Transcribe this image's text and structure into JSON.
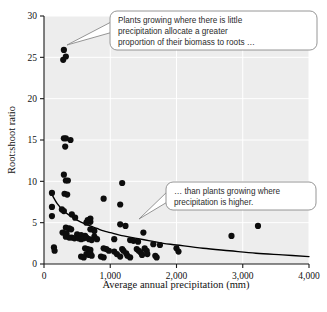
{
  "figure": {
    "name": "root-shoot-ratio-vs-precipitation-scatter"
  },
  "chart_data": {
    "type": "scatter",
    "title": "",
    "xlabel": "Average annual precipitation (mm)",
    "ylabel": "Root:shoot ratio",
    "xlim": [
      0,
      4000
    ],
    "ylim": [
      0,
      30
    ],
    "xticks": [
      0,
      1000,
      2000,
      3000,
      4000
    ],
    "xtick_labels": [
      "0",
      "1,000",
      "2,000",
      "3,000",
      "4,000"
    ],
    "yticks": [
      0,
      5,
      10,
      15,
      20,
      25,
      30
    ],
    "ytick_labels": [
      "0",
      "5",
      "10",
      "15",
      "20",
      "25",
      "30"
    ],
    "grid": true,
    "grid_color": "#ffffff",
    "plot_background": "#ededed",
    "marker_color": "#0d0d0d",
    "marker_shape": "circle",
    "marker_size_px": 3.1,
    "legend": null,
    "legend_position": "none",
    "points": [
      [
        300,
        25.9
      ],
      [
        290,
        24.7
      ],
      [
        330,
        25.1
      ],
      [
        300,
        15.2
      ],
      [
        330,
        15.2
      ],
      [
        400,
        15.0
      ],
      [
        320,
        14.2
      ],
      [
        300,
        10.8
      ],
      [
        330,
        10.1
      ],
      [
        360,
        10.1
      ],
      [
        1180,
        9.8
      ],
      [
        310,
        8.5
      ],
      [
        120,
        8.6
      ],
      [
        350,
        8.4
      ],
      [
        900,
        7.9
      ],
      [
        1150,
        7.2
      ],
      [
        120,
        6.9
      ],
      [
        270,
        6.6
      ],
      [
        300,
        6.4
      ],
      [
        120,
        5.8
      ],
      [
        420,
        6.0
      ],
      [
        470,
        5.6
      ],
      [
        700,
        5.5
      ],
      [
        660,
        5.3
      ],
      [
        700,
        5.1
      ],
      [
        640,
        5.0
      ],
      [
        1150,
        4.8
      ],
      [
        1230,
        4.6
      ],
      [
        3230,
        4.6
      ],
      [
        330,
        4.4
      ],
      [
        380,
        4.3
      ],
      [
        410,
        4.2
      ],
      [
        700,
        4.2
      ],
      [
        760,
        4.0
      ],
      [
        280,
        3.8
      ],
      [
        340,
        3.7
      ],
      [
        500,
        3.6
      ],
      [
        560,
        3.5
      ],
      [
        620,
        3.4
      ],
      [
        1500,
        3.8
      ],
      [
        2830,
        3.4
      ],
      [
        330,
        3.3
      ],
      [
        380,
        3.2
      ],
      [
        420,
        3.2
      ],
      [
        460,
        3.1
      ],
      [
        520,
        3.1
      ],
      [
        560,
        3.0
      ],
      [
        600,
        3.1
      ],
      [
        640,
        3.2
      ],
      [
        680,
        3.0
      ],
      [
        720,
        2.9
      ],
      [
        760,
        3.3
      ],
      [
        800,
        3.0
      ],
      [
        1060,
        3.0
      ],
      [
        1300,
        2.9
      ],
      [
        1350,
        2.8
      ],
      [
        1420,
        2.7
      ],
      [
        1650,
        2.4
      ],
      [
        1750,
        2.3
      ],
      [
        150,
        2.0
      ],
      [
        160,
        1.6
      ],
      [
        620,
        1.9
      ],
      [
        660,
        1.8
      ],
      [
        700,
        1.7
      ],
      [
        700,
        1.3
      ],
      [
        640,
        1.2
      ],
      [
        680,
        1.1
      ],
      [
        720,
        1.0
      ],
      [
        900,
        1.9
      ],
      [
        940,
        1.8
      ],
      [
        980,
        1.6
      ],
      [
        1060,
        1.5
      ],
      [
        1100,
        1.2
      ],
      [
        1180,
        1.8
      ],
      [
        1200,
        1.6
      ],
      [
        1240,
        1.3
      ],
      [
        1260,
        1.0
      ],
      [
        1400,
        1.8
      ],
      [
        1430,
        1.6
      ],
      [
        1460,
        1.4
      ],
      [
        1480,
        1.1
      ],
      [
        1520,
        1.9
      ],
      [
        1550,
        1.6
      ],
      [
        1560,
        1.2
      ],
      [
        1680,
        1.0
      ],
      [
        1700,
        0.8
      ],
      [
        2000,
        1.9
      ],
      [
        2030,
        1.5
      ],
      [
        860,
        0.9
      ],
      [
        900,
        0.8
      ],
      [
        1150,
        0.9
      ],
      [
        1300,
        0.8
      ],
      [
        560,
        0.9
      ],
      [
        600,
        0.8
      ]
    ],
    "trend_curve": {
      "description": "fitted declining power/decay curve through the scatter",
      "color": "#000000",
      "points": [
        [
          100,
          8.7
        ],
        [
          200,
          7.3
        ],
        [
          300,
          6.4
        ],
        [
          400,
          5.8
        ],
        [
          500,
          5.3
        ],
        [
          600,
          4.9
        ],
        [
          700,
          4.6
        ],
        [
          800,
          4.3
        ],
        [
          900,
          4.0
        ],
        [
          1000,
          3.8
        ],
        [
          1200,
          3.4
        ],
        [
          1400,
          3.1
        ],
        [
          1600,
          2.8
        ],
        [
          1800,
          2.5
        ],
        [
          2000,
          2.3
        ],
        [
          2400,
          1.9
        ],
        [
          2800,
          1.6
        ],
        [
          3200,
          1.3
        ],
        [
          3600,
          1.1
        ],
        [
          4000,
          0.9
        ]
      ]
    },
    "annotations": [
      {
        "id": "callout-upper",
        "lines": [
          "Plants growing where there is little",
          "precipitation allocate a greater",
          "proportion of their biomass to roots …"
        ],
        "points_to": "high root:shoot ratio points at low precipitation"
      },
      {
        "id": "callout-lower",
        "lines": [
          "… than plants growing where",
          "precipitation is higher."
        ],
        "points_to": "low root:shoot ratio points at high precipitation"
      }
    ]
  }
}
